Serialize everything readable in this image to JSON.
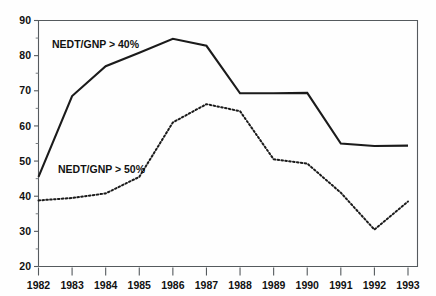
{
  "figure": {
    "background_color": "#fefefe",
    "ink_color": "#1b1b1b",
    "frame_color": "#555a5e"
  },
  "chart_data": {
    "type": "line",
    "title": "",
    "xlabel": "",
    "ylabel": "",
    "categories": [
      "1982",
      "1983",
      "1984",
      "1985",
      "1986",
      "1987",
      "1988",
      "1989",
      "1990",
      "1991",
      "1992",
      "1993"
    ],
    "x": [
      1982,
      1983,
      1984,
      1985,
      1986,
      1987,
      1988,
      1989,
      1990,
      1991,
      1992,
      1993
    ],
    "xlim": [
      1982,
      1993
    ],
    "ylim": [
      20,
      90
    ],
    "ytick_labels": [
      "20",
      "30",
      "40",
      "50",
      "60",
      "70",
      "80",
      "90"
    ],
    "yticks": [
      20,
      30,
      40,
      50,
      60,
      70,
      80,
      90
    ],
    "ytick_minor": [
      25,
      35,
      45,
      55,
      65,
      75,
      85
    ],
    "xtick_labels": [
      "1982",
      "1983",
      "1984",
      "1985",
      "1986",
      "1987",
      "1988",
      "1989",
      "1990",
      "1991",
      "1992",
      "1993"
    ],
    "grid": false,
    "legend_position": "inline-annotation",
    "series": [
      {
        "name": "NEDT/GNP > 40%",
        "style": "solid",
        "values": [
          45.5,
          68.5,
          77.0,
          80.8,
          84.8,
          82.8,
          69.3,
          69.3,
          69.4,
          55.0,
          54.3,
          54.4
        ]
      },
      {
        "name": "NEDT/GNP > 50%",
        "style": "dotted",
        "values": [
          38.8,
          39.5,
          40.8,
          45.5,
          61.0,
          66.2,
          64.2,
          50.5,
          49.3,
          41.0,
          30.5,
          38.5
        ]
      }
    ],
    "annotations": [
      {
        "text": "NEDT/GNP > 40%",
        "x_px": 52,
        "y_px": 48
      },
      {
        "text": "NEDT/GNP > 50%",
        "x_px": 58,
        "y_px": 173
      }
    ]
  }
}
